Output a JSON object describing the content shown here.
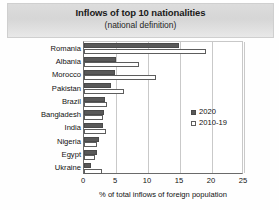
{
  "title": {
    "main": "Inflows of top 10 nationalities",
    "sub": "(national definition)"
  },
  "legend": {
    "position": "center-right",
    "items": [
      {
        "label": "2020",
        "style": "filled",
        "color": "#595959"
      },
      {
        "label": "2010-19",
        "style": "hollow",
        "color": "#ffffff"
      }
    ]
  },
  "axis": {
    "xlabel": "% of total inflows of foreign population",
    "ticks": [
      "0",
      "5",
      "10",
      "15",
      "20",
      "25"
    ]
  },
  "chart_data": {
    "type": "bar",
    "orientation": "horizontal",
    "title": "Inflows of top 10 nationalities",
    "subtitle": "(national definition)",
    "xlabel": "% of total inflows of foreign population",
    "ylabel": "",
    "xlim": [
      0,
      25
    ],
    "grid": true,
    "legend_position": "center-right",
    "categories": [
      "Romania",
      "Albania",
      "Morocco",
      "Pakistan",
      "Brazil",
      "Bangladesh",
      "India",
      "Nigeria",
      "Egypt",
      "Ukraine"
    ],
    "series": [
      {
        "name": "2020",
        "color": "#595959",
        "values": [
          14.8,
          5.0,
          4.9,
          4.2,
          3.3,
          3.2,
          3.0,
          2.3,
          2.0,
          1.1
        ]
      },
      {
        "name": "2010-19",
        "color": "#ffffff",
        "values": [
          19.1,
          8.6,
          11.3,
          6.3,
          3.6,
          3.0,
          3.4,
          2.0,
          1.7,
          2.8
        ]
      }
    ]
  }
}
